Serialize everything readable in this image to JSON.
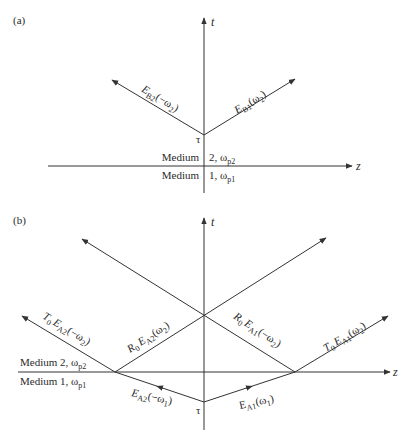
{
  "panels": [
    {
      "id": "a",
      "label": "(a)",
      "t_axis_label": "t",
      "z_axis_label": "z",
      "origin_label": "τ",
      "medium_upper": {
        "word": "Medium",
        "value": "2, ω",
        "sub": "p2"
      },
      "medium_lower": {
        "word": "Medium",
        "value": "1, ω",
        "sub": "p1"
      },
      "waves": [
        {
          "name": "E",
          "sub": "B2",
          "arg": "(−ω",
          "argsub": "2",
          "close": ")"
        },
        {
          "name": "E",
          "sub": "B1",
          "arg": "(ω",
          "argsub": "2",
          "close": ")"
        }
      ]
    },
    {
      "id": "b",
      "label": "(b)",
      "t_axis_label": "t",
      "z_axis_label": "z",
      "origin_label": "τ",
      "medium_upper": {
        "text": "Medium 2, ω",
        "sub": "p2"
      },
      "medium_lower": {
        "text": "Medium 1, ω",
        "sub": "p1"
      },
      "waves": [
        {
          "coef": "T",
          "coefsub": "0",
          "name": "E",
          "sub": "A2",
          "arg": "(−ω",
          "argsub": "2",
          "close": ")"
        },
        {
          "coef": "R",
          "coefsub": "0",
          "name": "E",
          "sub": "A2",
          "arg": "(ω",
          "argsub": "2",
          "close": ")"
        },
        {
          "coef": "R",
          "coefsub": "0",
          "name": "E",
          "sub": "A1",
          "arg": "(−ω",
          "argsub": "2",
          "close": ")"
        },
        {
          "coef": "T",
          "coefsub": "0",
          "name": "E",
          "sub": "A1",
          "arg": "(ω",
          "argsub": "2",
          "close": ")"
        },
        {
          "coef": "",
          "coefsub": "",
          "name": "E",
          "sub": "A2",
          "arg": "(−ω",
          "argsub": "1",
          "close": ")"
        },
        {
          "coef": "",
          "coefsub": "",
          "name": "E",
          "sub": "A1",
          "arg": "(ω",
          "argsub": "1",
          "close": ")"
        }
      ]
    }
  ],
  "colors": {
    "line": "#333333",
    "text": "#2a2a2a",
    "background": "#ffffff"
  }
}
